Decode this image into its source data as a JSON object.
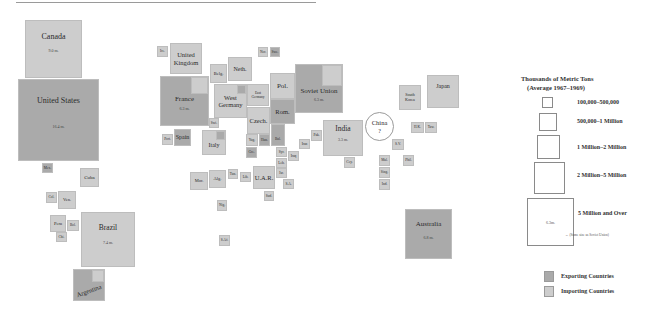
{
  "legend": {
    "title_line1": "Thousands of Metric Tons",
    "title_line2": "(Average 1967–1969)",
    "sizes": [
      {
        "label": "100,000–500,000"
      },
      {
        "label": "500,000–1 Million"
      },
      {
        "label": "1 Million–2 Million"
      },
      {
        "label": "2 Million–5 Million"
      },
      {
        "label": "5 Million and Over",
        "example_value": "6.3m.",
        "note": "← (Same size as Soviet Union)"
      }
    ],
    "exporting_label": "Exporting Countries",
    "importing_label": "Importing Countries",
    "exporting_color": "#aaaaaa",
    "importing_color": "#cdcdcd"
  },
  "countries": {
    "canada": {
      "name": "Canada",
      "value": "9.0 m."
    },
    "united_states": {
      "name": "United States",
      "value": "16.4 m."
    },
    "mexico": {
      "name": "Mex."
    },
    "cuba": {
      "name": "Cuba"
    },
    "colombia": {
      "name": "Col."
    },
    "venezuela": {
      "name": "Ven."
    },
    "peru": {
      "name": "Peru"
    },
    "bolivia": {
      "name": "Bol."
    },
    "chile": {
      "name": "Chi."
    },
    "brazil": {
      "name": "Brazil",
      "value": "7.4 m."
    },
    "argentina": {
      "name": "Argentina"
    },
    "ireland": {
      "name": "Ire."
    },
    "united_kingdom": {
      "name": "United Kingdom"
    },
    "norway": {
      "name": "Nor."
    },
    "sweden": {
      "name": "Swe."
    },
    "belgium": {
      "name": "Belg."
    },
    "netherlands": {
      "name": "Neth."
    },
    "france": {
      "name": "France",
      "value": "6.3 m."
    },
    "west_germany": {
      "name": "West Germany"
    },
    "east_germany": {
      "name": "East Germany"
    },
    "poland": {
      "name": "Pol."
    },
    "romania": {
      "name": "Rom."
    },
    "soviet_union": {
      "name": "Soviet Union",
      "value": "6.3 m."
    },
    "czech": {
      "name": "Czech."
    },
    "switzerland": {
      "name": "Swi."
    },
    "portugal": {
      "name": "Port."
    },
    "spain": {
      "name": "Spain"
    },
    "italy": {
      "name": "Italy"
    },
    "yugoslavia": {
      "name": "Yug."
    },
    "hungary": {
      "name": "Hun."
    },
    "bulgaria": {
      "name": "Bul."
    },
    "greece": {
      "name": "Gre."
    },
    "syria": {
      "name": "Syr."
    },
    "lebanon": {
      "name": "Leb."
    },
    "iraq": {
      "name": "Iraq"
    },
    "iran": {
      "name": "Iran"
    },
    "pakistan": {
      "name": "Pak."
    },
    "india": {
      "name": "India",
      "value": "3.3 m."
    },
    "ceylon": {
      "name": "Cey."
    },
    "israel": {
      "name": "Isr."
    },
    "saudi_arabia": {
      "name": "S.A."
    },
    "uar": {
      "name": "U.A.R."
    },
    "sudan": {
      "name": "Sud."
    },
    "libya": {
      "name": "Lib."
    },
    "tunisia": {
      "name": "Tun."
    },
    "algeria": {
      "name": "Alg."
    },
    "morocco": {
      "name": "Mor."
    },
    "nigeria": {
      "name": "Nig."
    },
    "south_africa": {
      "name": "S.Af."
    },
    "china": {
      "name": "China",
      "value": "?"
    },
    "south_korea": {
      "name": "South Korea"
    },
    "japan": {
      "name": "Japan"
    },
    "hong_kong": {
      "name": "H.K."
    },
    "taiwan": {
      "name": "Taw."
    },
    "south_vietnam": {
      "name": "S.V."
    },
    "malaysia": {
      "name": "Mal."
    },
    "philippines": {
      "name": "Phil."
    },
    "singapore": {
      "name": "Sing."
    },
    "indonesia": {
      "name": "Ind."
    },
    "australia": {
      "name": "Australia",
      "value": "6.8 m."
    }
  }
}
